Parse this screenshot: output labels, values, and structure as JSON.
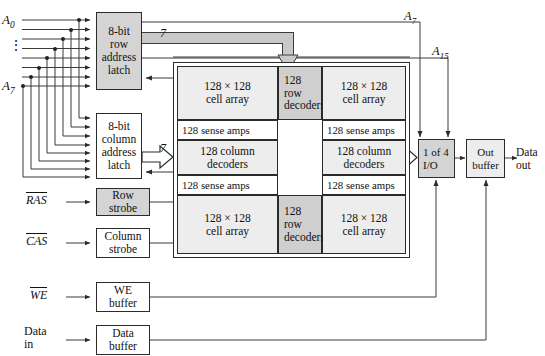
{
  "figure": {
    "colors": {
      "shade": "#d4d4d4",
      "shade_dark": "#cfcfcf",
      "light": "#ededed",
      "line": "#3a3a3a",
      "text": "#111111"
    }
  },
  "address_inputs": {
    "top_label": "A",
    "top_sub": "0",
    "bottom_label": "A",
    "bottom_sub": "7",
    "ellipsis": "⋮",
    "line_count": 8
  },
  "latches": {
    "row": {
      "l1": "8-bit",
      "l2": "row",
      "l3": "address",
      "l4": "latch"
    },
    "column": {
      "l1": "8-bit",
      "l2": "column",
      "l3": "address",
      "l4": "latch"
    }
  },
  "bus_labels": {
    "row_bus": "7",
    "column_bus": "7"
  },
  "strobes": {
    "ras_signal": "RAS",
    "ras_block": {
      "l1": "Row",
      "l2": "strobe"
    },
    "cas_signal": "CAS",
    "cas_block": {
      "l1": "Column",
      "l2": "strobe"
    },
    "we_signal": "WE",
    "we_block": {
      "l1": "WE",
      "l2": "buffer"
    },
    "data_in_l1": "Data",
    "data_in_l2": "in",
    "data_block": {
      "l1": "Data",
      "l2": "buffer"
    }
  },
  "memory_array": {
    "cell_arrays": [
      {
        "l1": "128 × 128",
        "l2": "cell array"
      },
      {
        "l1": "128 × 128",
        "l2": "cell array"
      },
      {
        "l1": "128 × 128",
        "l2": "cell array"
      },
      {
        "l1": "128 × 128",
        "l2": "cell array"
      }
    ],
    "row_decoders": [
      {
        "l1": "128",
        "l2": "row",
        "l3": "decoders"
      },
      {
        "l1": "128",
        "l2": "row",
        "l3": "decoders"
      }
    ],
    "sense_amps": [
      "128 sense amps",
      "128 sense amps",
      "128 sense amps",
      "128 sense amps"
    ],
    "column_decoders": [
      {
        "l1": "128 column",
        "l2": "decoders"
      },
      {
        "l1": "128 column",
        "l2": "decoders"
      }
    ]
  },
  "io": {
    "mux": {
      "l1": "1 of 4",
      "l2": "I/O"
    },
    "out_buffer": {
      "l1": "Out",
      "l2": "buffer"
    },
    "data_out_l1": "Data",
    "data_out_l2": "out"
  },
  "top_addresses": {
    "a7_label": "A",
    "a7_sub": "7",
    "a15_label": "A",
    "a15_sub": "15"
  }
}
